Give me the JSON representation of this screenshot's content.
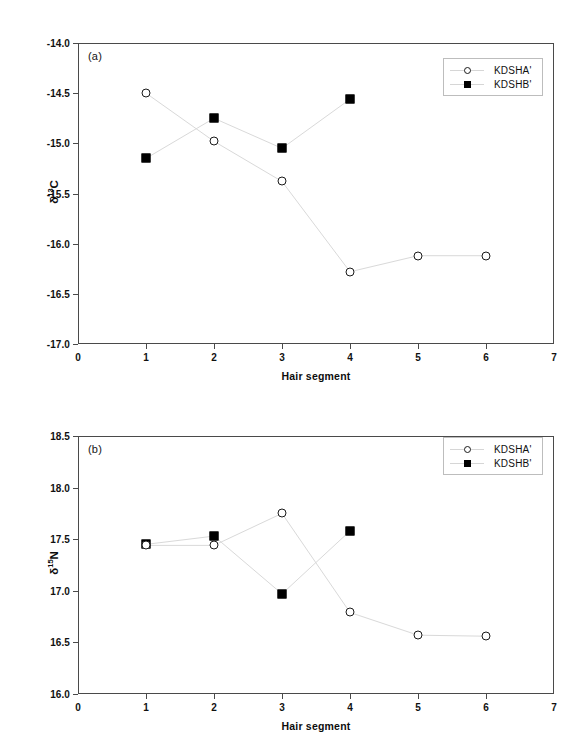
{
  "figure": {
    "panels": [
      {
        "id": "a",
        "letter": "(a)",
        "chart_index": 0
      },
      {
        "id": "b",
        "letter": "(b)",
        "chart_index": 1
      }
    ]
  },
  "chart_data": [
    {
      "type": "line",
      "title": "",
      "panel_label": "(a)",
      "xlabel": "Hair segment",
      "ylabel": "δ13C",
      "ylabel_parts": {
        "delta": "δ",
        "sup": "13",
        "element": "C"
      },
      "x": [
        1,
        2,
        3,
        4,
        5,
        6
      ],
      "xlim": [
        0,
        7
      ],
      "ylim": [
        -17.0,
        -14.0
      ],
      "xticks": [
        "0",
        "1",
        "2",
        "3",
        "4",
        "5",
        "6",
        "7"
      ],
      "yticks": [
        "-14.0",
        "-14.5",
        "-15.0",
        "-15.5",
        "-16.0",
        "-16.5",
        "-17.0"
      ],
      "grid": false,
      "legend_position": "top-right",
      "series": [
        {
          "name": "KDSHA'",
          "marker": "open-circle",
          "x": [
            1,
            2,
            3,
            4,
            5,
            6
          ],
          "values": [
            -14.5,
            -14.98,
            -15.38,
            -16.28,
            -16.12,
            -16.12
          ]
        },
        {
          "name": "KDSHB'",
          "marker": "filled-square",
          "x": [
            1,
            2,
            3,
            4
          ],
          "values": [
            -15.15,
            -14.75,
            -15.05,
            -14.56
          ]
        }
      ]
    },
    {
      "type": "line",
      "title": "",
      "panel_label": "(b)",
      "xlabel": "Hair segment",
      "ylabel": "δ15N",
      "ylabel_parts": {
        "delta": "δ",
        "sup": "15",
        "element": "N"
      },
      "x": [
        1,
        2,
        3,
        4,
        5,
        6
      ],
      "xlim": [
        0,
        7
      ],
      "ylim": [
        16.0,
        18.5
      ],
      "xticks": [
        "0",
        "1",
        "2",
        "3",
        "4",
        "5",
        "6",
        "7"
      ],
      "yticks": [
        "18.5",
        "18.0",
        "17.5",
        "17.0",
        "16.5",
        "16.0"
      ],
      "grid": false,
      "legend_position": "top-right",
      "series": [
        {
          "name": "KDSHA'",
          "marker": "open-circle",
          "x": [
            1,
            2,
            3,
            4,
            5,
            6
          ],
          "values": [
            17.44,
            17.44,
            17.75,
            16.79,
            16.57,
            16.56
          ]
        },
        {
          "name": "KDSHB'",
          "marker": "filled-square",
          "x": [
            1,
            2,
            3,
            4
          ],
          "values": [
            17.45,
            17.53,
            16.97,
            17.58
          ]
        }
      ]
    }
  ],
  "colors": {
    "marker_open_stroke": "#1a1a1a",
    "marker_filled": "#000000",
    "line": "#d9d9d9",
    "axis": "#4a4a4a",
    "text": "#111111",
    "background": "#ffffff"
  }
}
